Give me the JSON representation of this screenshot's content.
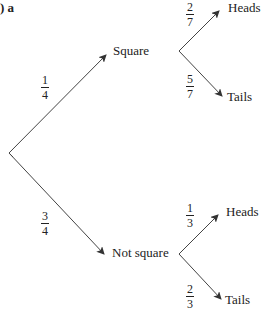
{
  "title": ") a",
  "tree": {
    "root": {
      "label": ""
    },
    "level1": [
      {
        "label": "Square",
        "prob": {
          "num": "1",
          "den": "4"
        },
        "children": [
          {
            "label": "Heads",
            "prob": {
              "num": "2",
              "den": "7"
            }
          },
          {
            "label": "Tails",
            "prob": {
              "num": "5",
              "den": "7"
            }
          }
        ]
      },
      {
        "label": "Not square",
        "prob": {
          "num": "3",
          "den": "4"
        },
        "children": [
          {
            "label": "Heads",
            "prob": {
              "num": "1",
              "den": "3"
            }
          },
          {
            "label": "Tails",
            "prob": {
              "num": "2",
              "den": "3"
            }
          }
        ]
      }
    ]
  }
}
